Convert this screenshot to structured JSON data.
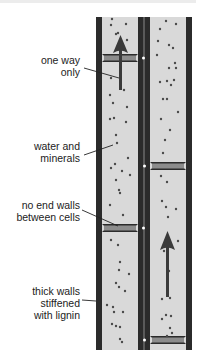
{
  "labels": {
    "one_way": [
      "one way",
      "only"
    ],
    "water": [
      "water and",
      "minerals"
    ],
    "no_end_walls": [
      "no end walls",
      "between cells"
    ],
    "thick_walls": [
      "thick walls",
      "stiffened",
      "with lignin"
    ]
  },
  "colors": {
    "wall": "#2b2b2b",
    "lumen": "#d9d9d9",
    "plate": "#8c8c8c",
    "particle": "#4a4a4a",
    "arrow": "#3a3a3a",
    "text": "#222222"
  },
  "vessels": [
    {
      "name": "left",
      "wall_left_x": 96,
      "wall_right_x": 138,
      "plates_y": [
        58,
        228
      ]
    },
    {
      "name": "right",
      "wall_left_x": 145,
      "wall_right_x": 186,
      "plates_y": [
        166,
        340
      ]
    }
  ]
}
